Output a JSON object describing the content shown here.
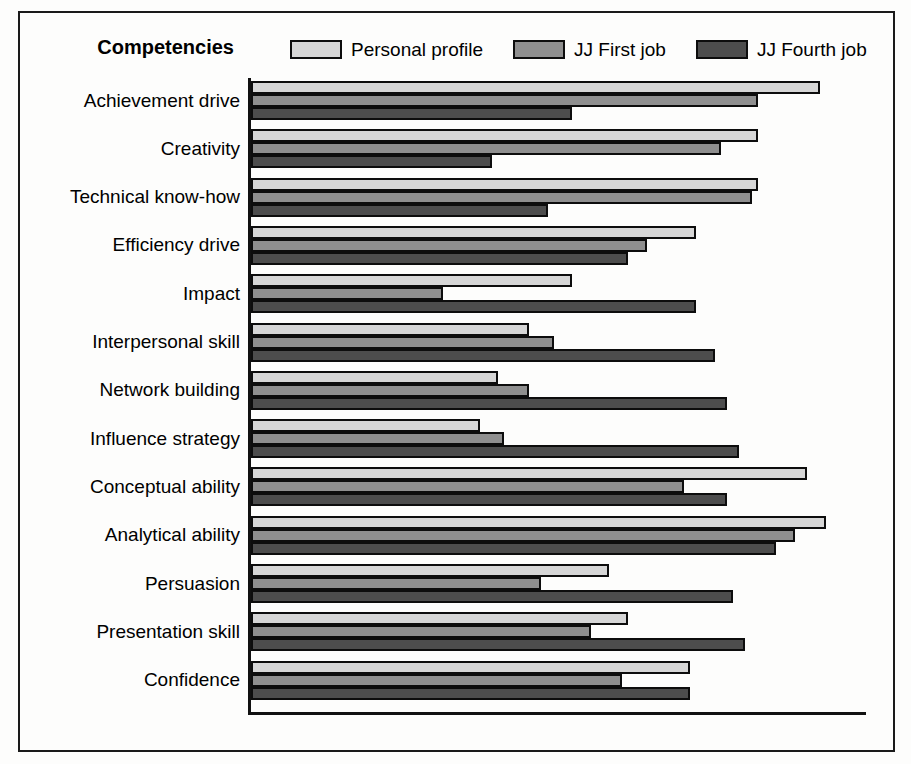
{
  "figure": {
    "axis_title": "Competencies",
    "background": "#fdfdfc",
    "frame_color": "#1a1a1a"
  },
  "legend": {
    "position": "top",
    "entries": [
      {
        "label": "Personal profile",
        "color": "#d6d6d6",
        "swatch_name": "legend-swatch-personal-profile"
      },
      {
        "label": "JJ First job",
        "color": "#8f8f8f",
        "swatch_name": "legend-swatch-jj-first-job"
      },
      {
        "label": "JJ Fourth job",
        "color": "#4d4d4d",
        "swatch_name": "legend-swatch-jj-fourth-job"
      }
    ]
  },
  "chart_data": {
    "type": "bar",
    "orientation": "horizontal",
    "title": "",
    "subtitle": "",
    "xlabel": "",
    "ylabel": "Competencies",
    "grid": false,
    "legend_position": "top",
    "axis_max": 100,
    "xlim": [
      0,
      100
    ],
    "tick_labels": [],
    "categories": [
      "Achievement drive",
      "Creativity",
      "Technical know-how",
      "Efficiency drive",
      "Impact",
      "Interpersonal skill",
      "Network building",
      "Influence strategy",
      "Conceptual ability",
      "Analytical ability",
      "Persuasion",
      "Presentation skill",
      "Confidence"
    ],
    "series": [
      {
        "name": "Personal profile",
        "color": "#d6d6d6",
        "values": [
          92,
          82,
          82,
          72,
          52,
          45,
          40,
          37,
          90,
          93,
          58,
          61,
          71
        ]
      },
      {
        "name": "JJ First job",
        "color": "#8f8f8f",
        "values": [
          82,
          76,
          81,
          64,
          31,
          49,
          45,
          41,
          70,
          88,
          47,
          55,
          60
        ]
      },
      {
        "name": "JJ Fourth job",
        "color": "#4d4d4d",
        "values": [
          52,
          39,
          48,
          61,
          72,
          75,
          77,
          79,
          77,
          85,
          78,
          80,
          71
        ]
      }
    ]
  }
}
